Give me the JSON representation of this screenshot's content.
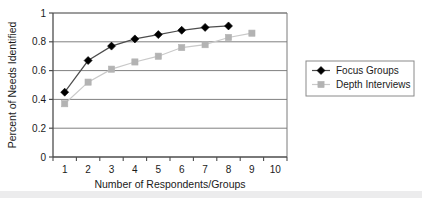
{
  "chart_data": {
    "type": "line",
    "title": "",
    "xlabel": "Number of Respondents/Groups",
    "ylabel": "Percent of Needs Identified",
    "x": [
      1,
      2,
      3,
      4,
      5,
      6,
      7,
      8,
      9,
      10
    ],
    "xtick_labels": [
      "1",
      "2",
      "3",
      "4",
      "5",
      "6",
      "7",
      "8",
      "9",
      "10"
    ],
    "ytick_labels": [
      "0",
      "0.2",
      "0.4",
      "0.6",
      "0.8",
      "1"
    ],
    "yticks": [
      0,
      0.2,
      0.4,
      0.6,
      0.8,
      1
    ],
    "xlim": [
      0.5,
      10.5
    ],
    "ylim": [
      0,
      1
    ],
    "grid": "horizontal",
    "legend_position": "right",
    "series": [
      {
        "name": "Focus Groups",
        "marker": "diamond",
        "color": "#000000",
        "line_color": "#4d4d4d",
        "x": [
          1,
          2,
          3,
          4,
          5,
          6,
          7,
          8
        ],
        "values": [
          0.45,
          0.67,
          0.77,
          0.82,
          0.85,
          0.88,
          0.9,
          0.91
        ]
      },
      {
        "name": "Depth Interviews",
        "marker": "square",
        "color": "#b3b3b3",
        "line_color": "#c9c9c9",
        "x": [
          1,
          2,
          3,
          4,
          5,
          6,
          7,
          8,
          9
        ],
        "values": [
          0.37,
          0.52,
          0.61,
          0.66,
          0.7,
          0.76,
          0.78,
          0.83,
          0.86
        ]
      }
    ]
  },
  "legend": {
    "entries": [
      {
        "label": "Focus Groups"
      },
      {
        "label": "Depth Interviews"
      }
    ]
  },
  "axes": {
    "y_title": "Percent of Needs Identified",
    "x_title": "Number of Respondents/Groups"
  },
  "colors": {
    "series_focus_groups": "#000000",
    "series_depth_interviews": "#b3b3b3",
    "gridline": "#808080",
    "axis": "#595959",
    "plot_border": "#6b6b6b",
    "bottom_band": "#ececed"
  }
}
